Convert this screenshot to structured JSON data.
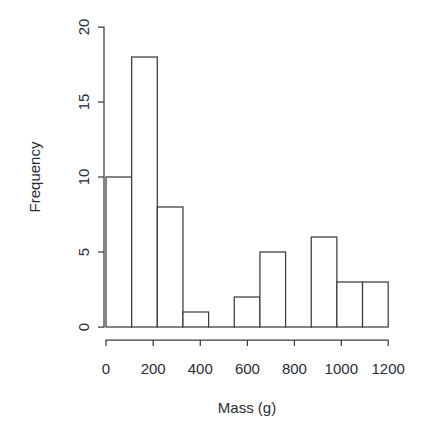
{
  "chart_data": {
    "type": "bar",
    "title": "",
    "subtitle": "",
    "xlabel": "Mass (g)",
    "ylabel": "Frequency",
    "bin_width": 100,
    "bin_edges": [
      0,
      100,
      200,
      300,
      400,
      500,
      600,
      700,
      800,
      900,
      1000,
      1100
    ],
    "categories": [
      "0-100",
      "100-200",
      "200-300",
      "300-400",
      "400-500",
      "500-600",
      "600-700",
      "700-800",
      "800-900",
      "900-1000",
      "1000-1100"
    ],
    "values": [
      10,
      18,
      8,
      1,
      0,
      2,
      5,
      0,
      6,
      3,
      3
    ],
    "xlim": [
      0,
      1200
    ],
    "ylim": [
      0,
      20
    ],
    "x_ticks": [
      0,
      200,
      400,
      600,
      800,
      1000,
      1200
    ],
    "x_tick_labels": [
      "0",
      "200",
      "400",
      "600",
      "800",
      "1000",
      "1200"
    ],
    "y_ticks": [
      0,
      5,
      10,
      15,
      20
    ],
    "y_tick_labels": [
      "0",
      "5",
      "10",
      "15",
      "20"
    ],
    "grid": false,
    "legend": false,
    "legend_position": "none",
    "bar_fill_color": "#ffffff",
    "bar_stroke_color": "#3a3a44",
    "background_color": "#ffffff",
    "text_color": "#2b2b38"
  },
  "axis": {
    "y_title": "Frequency",
    "x_title": "Mass (g)",
    "x_tick_0": "0",
    "x_tick_1": "200",
    "x_tick_2": "400",
    "x_tick_3": "600",
    "x_tick_4": "800",
    "x_tick_5": "1000",
    "x_tick_6": "1200",
    "y_tick_0": "0",
    "y_tick_1": "5",
    "y_tick_2": "10",
    "y_tick_3": "15",
    "y_tick_4": "20"
  }
}
